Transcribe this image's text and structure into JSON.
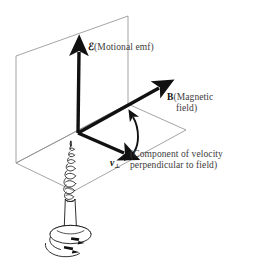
{
  "figure": {
    "background_color": "#ffffff",
    "line_color": "#111111",
    "plane_color": "#8d8d8d",
    "text_color": "#3b3b3b",
    "symbol_color": "#0d0d0d"
  },
  "axes": {
    "emf": {
      "symbol": "ℰ",
      "description": "(Motional emf)",
      "direction": "up",
      "origin": [
        78,
        133
      ],
      "tip": [
        79,
        48
      ]
    },
    "magnetic_field": {
      "symbol": "B",
      "description_line1": "(Magnetic",
      "description_line2": "field)",
      "direction": "upper-right",
      "origin": [
        78,
        133
      ],
      "tip": [
        163,
        85
      ]
    },
    "velocity": {
      "symbol": "v",
      "subscript": "⊥",
      "description_line1": "(Component of velocity",
      "description_line2": "perpendicular to field)",
      "direction": "lower-right",
      "origin": [
        78,
        133
      ],
      "tip": [
        128,
        156
      ]
    }
  },
  "annotations": {
    "rotation_arrow": "curved-arrow-from-velocity-to-field",
    "screw": {
      "name": "right-hand-screw",
      "thread_turns": 8,
      "rotation_indicator": "clockwise-arrows-at-head"
    }
  },
  "planes": {
    "vertical_plane": "back vertical parallelogram containing emf axis",
    "horizontal_plane": "ground parallelogram containing B and v axes"
  }
}
